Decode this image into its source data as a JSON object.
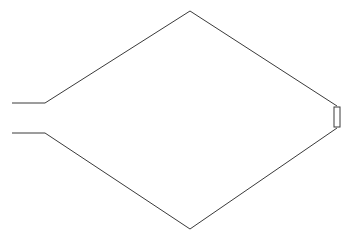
{
  "canvas": {
    "width": 353,
    "height": 242,
    "background_color": "#ffffff",
    "title": "Line Drawing"
  },
  "style": {
    "stroke_color": "#3a3a3a",
    "stroke_width": 1,
    "fill": "none"
  },
  "drawing": {
    "description": "Technical line drawing of an elongated hexagonal arrowhead / fin profile with two parallel horizontal tail lines extending to the left and a small rectangular tab at the right vertex.",
    "shapes": [
      {
        "name": "upper-outline",
        "kind": "polyline",
        "points": "12,103 45,103 190,11 337,106"
      },
      {
        "name": "lower-outline",
        "kind": "polyline",
        "points": "12,133 45,133 190,229 337,128"
      },
      {
        "name": "right-tab",
        "kind": "rect",
        "x": 334,
        "y": 107,
        "width": 6,
        "height": 20
      }
    ],
    "vertices": {
      "upper_tail_start": "12,103",
      "upper_tail_bend": "45,103",
      "top_apex": "190,11",
      "upper_right_junction": "337,106",
      "lower_tail_start": "12,133",
      "lower_tail_bend": "45,133",
      "bottom_apex": "190,229",
      "lower_right_junction": "337,128"
    }
  }
}
